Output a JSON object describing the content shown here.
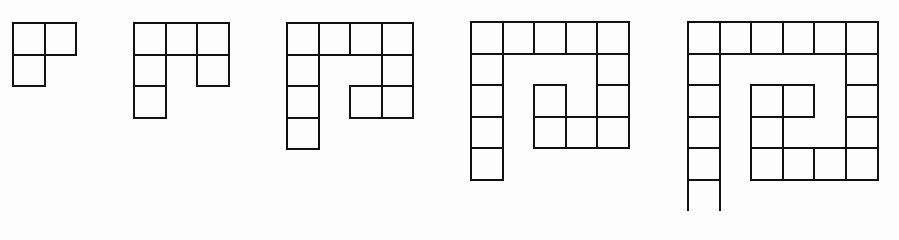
{
  "diagram": {
    "cell_size": 31.6,
    "line_color": "#111111",
    "background": "#fdfdfd",
    "figures": [
      {
        "id": 1,
        "left": 12,
        "top": 22,
        "cells": [
          [
            0,
            0
          ],
          [
            0,
            1
          ],
          [
            1,
            0
          ]
        ]
      },
      {
        "id": 2,
        "left": 133,
        "top": 22,
        "cells": [
          [
            0,
            0
          ],
          [
            0,
            1
          ],
          [
            0,
            2
          ],
          [
            1,
            0
          ],
          [
            1,
            2
          ],
          [
            2,
            0
          ]
        ]
      },
      {
        "id": 3,
        "left": 286,
        "top": 22,
        "cells": [
          [
            0,
            0
          ],
          [
            0,
            1
          ],
          [
            0,
            2
          ],
          [
            0,
            3
          ],
          [
            1,
            0
          ],
          [
            1,
            3
          ],
          [
            2,
            0
          ],
          [
            2,
            2
          ],
          [
            2,
            3
          ],
          [
            3,
            0
          ]
        ]
      },
      {
        "id": 4,
        "left": 470,
        "top": 21,
        "cells": [
          [
            0,
            0
          ],
          [
            0,
            1
          ],
          [
            0,
            2
          ],
          [
            0,
            3
          ],
          [
            0,
            4
          ],
          [
            1,
            0
          ],
          [
            1,
            4
          ],
          [
            2,
            0
          ],
          [
            2,
            2
          ],
          [
            2,
            4
          ],
          [
            3,
            0
          ],
          [
            3,
            2
          ],
          [
            3,
            3
          ],
          [
            3,
            4
          ],
          [
            4,
            0
          ]
        ]
      },
      {
        "id": 5,
        "left": 687,
        "top": 21,
        "cells": [
          [
            0,
            0
          ],
          [
            0,
            1
          ],
          [
            0,
            2
          ],
          [
            0,
            3
          ],
          [
            0,
            4
          ],
          [
            0,
            5
          ],
          [
            1,
            0
          ],
          [
            1,
            5
          ],
          [
            2,
            0
          ],
          [
            2,
            2
          ],
          [
            2,
            3
          ],
          [
            2,
            5
          ],
          [
            3,
            0
          ],
          [
            3,
            2
          ],
          [
            3,
            5
          ],
          [
            4,
            0
          ],
          [
            4,
            2
          ],
          [
            4,
            3
          ],
          [
            4,
            4
          ],
          [
            4,
            5
          ],
          [
            5,
            0
          ]
        ]
      }
    ]
  }
}
